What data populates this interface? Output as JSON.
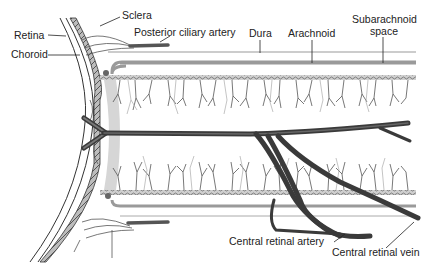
{
  "diagram": {
    "labels": {
      "sclera": "Sclera",
      "retina": "Retina",
      "choroid": "Choroid",
      "posterior_ciliary_artery": "Posterior ciliary artery",
      "dura": "Dura",
      "arachnoid": "Arachnoid",
      "subarachnoid_space_line1": "Subarachnoid",
      "subarachnoid_space_line2": "space",
      "central_retinal_artery": "Central retinal artery",
      "central_retinal_vein": "Central retinal vein"
    },
    "colors": {
      "vessel": "#3a3a3a",
      "sheath": "#9a9a9a",
      "light_gray": "#c8c8c8",
      "text": "#222222"
    }
  }
}
